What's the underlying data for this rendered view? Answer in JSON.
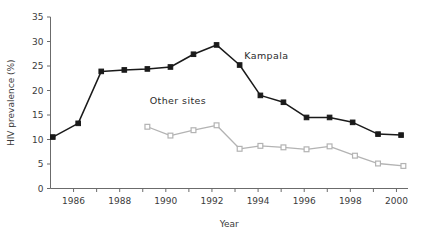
{
  "chart_data": {
    "type": "line",
    "title": "",
    "xlabel": "Year",
    "ylabel": "HIV prevalence (%)",
    "xlim": [
      1985,
      2000.5
    ],
    "ylim": [
      0,
      35
    ],
    "yticks": [
      0,
      5,
      10,
      15,
      20,
      25,
      30,
      35
    ],
    "ytick_labels": [
      "0",
      "5",
      "10",
      "15",
      "20",
      "25",
      "30",
      "35"
    ],
    "xticks": [
      1986,
      1987,
      1988,
      1989,
      1990,
      1991,
      1992,
      1993,
      1994,
      1995,
      1996,
      1997,
      1998,
      1999,
      2000
    ],
    "xtick_labels": [
      "1986",
      "",
      "1988",
      "",
      "1990",
      "",
      "1992",
      "",
      "1994",
      "",
      "1996",
      "",
      "1998",
      "",
      "2000"
    ],
    "xtick_labels_shown": [
      "1986",
      "1988",
      "1990",
      "1992",
      "1994",
      "1996",
      "1998",
      "2000"
    ],
    "grid": false,
    "legend_position": "inline-annotations",
    "series": [
      {
        "name": "Kampala",
        "color": "#1a1a1a",
        "marker": "filled-square",
        "x": [
          1985.1,
          1986.2,
          1987.2,
          1988.2,
          1989.2,
          1990.2,
          1991.2,
          1992.2,
          1993.2,
          1994.1,
          1995.1,
          1996.1,
          1997.1,
          1998.1,
          1999.2,
          2000.2
        ],
        "values": [
          10.5,
          13.3,
          23.9,
          24.2,
          24.4,
          24.8,
          27.4,
          29.3,
          25.2,
          19.0,
          17.6,
          14.5,
          14.5,
          13.5,
          11.1,
          10.9
        ]
      },
      {
        "name": "Other sites",
        "color": "#b3b3b3",
        "marker": "open-square",
        "x": [
          1989.2,
          1990.2,
          1991.2,
          1992.2,
          1993.2,
          1994.1,
          1995.1,
          1996.1,
          1997.1,
          1998.2,
          1999.2,
          2000.3
        ],
        "values": [
          12.6,
          10.8,
          11.9,
          12.9,
          8.1,
          8.7,
          8.4,
          8.0,
          8.6,
          6.7,
          5.1,
          4.6
        ]
      }
    ],
    "annotations": [
      {
        "text": "Kampala",
        "x": 1993.4,
        "y": 26.4
      },
      {
        "text": "Other sites",
        "x": 1989.3,
        "y": 17.2
      }
    ]
  },
  "colors": {
    "kampala": "#1a1a1a",
    "other_sites": "#b3b3b3",
    "axis": "#6b6b6b",
    "text": "#3b3b3b",
    "background": "#ffffff"
  }
}
